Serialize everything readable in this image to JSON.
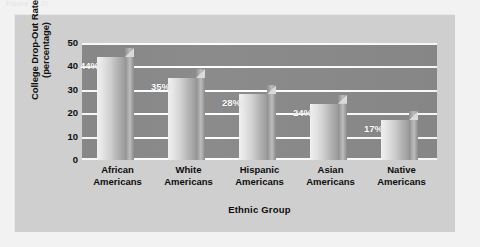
{
  "caption_sliver": "Figure (4.2)",
  "figure": {
    "panel_color": "#cfcfcf",
    "plot_color": "#8b8b8b",
    "gridline_color": "#ffffff",
    "label_color": "#ffffff"
  },
  "chart_data": {
    "type": "bar",
    "title": "",
    "categories": [
      "African Americans",
      "White Americans",
      "Hispanic Americans",
      "Asian Americans",
      "Native Americans"
    ],
    "category_lines": [
      [
        "African",
        "Americans"
      ],
      [
        "White",
        "Americans"
      ],
      [
        "Hispanic",
        "Americans"
      ],
      [
        "Asian",
        "Americans"
      ],
      [
        "Native",
        "Americans"
      ]
    ],
    "values": [
      44,
      35,
      28,
      24,
      17
    ],
    "value_labels": [
      "44%",
      "35%",
      "28%",
      "24%",
      "17%"
    ],
    "xlabel": "Ethnic Group",
    "ylabel": "College Drop-Out Rate (percentage)",
    "ylabel_lines": [
      "College Drop-Out Rate",
      "(percentage)"
    ],
    "ylim": [
      0,
      50
    ],
    "yticks": [
      0,
      10,
      20,
      30,
      40,
      50
    ],
    "ytick_labels": [
      "0",
      "10",
      "20",
      "30",
      "40",
      "50"
    ],
    "grid": true,
    "legend": "none",
    "orientation": "vertical",
    "style": "3d"
  }
}
